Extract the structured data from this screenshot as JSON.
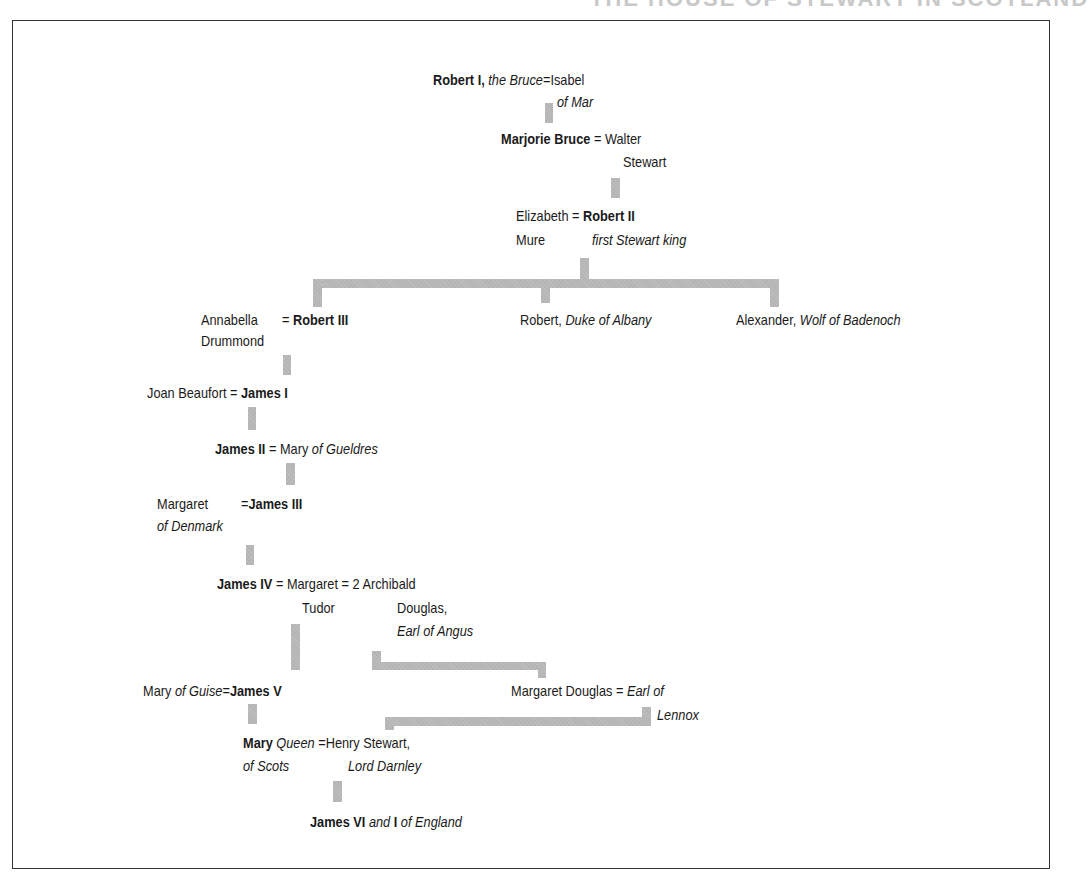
{
  "title": "THE HOUSE OF STEWART IN SCOTLAND",
  "colors": {
    "connector": "#b5b5b5",
    "text": "#1a1a1a",
    "frame": "#333333"
  },
  "tree": {
    "robert_i": {
      "name": "Robert I,",
      "epithet": "the Bruce"
    },
    "isabel": {
      "line1": "Isabel",
      "line2": "of Mar"
    },
    "marjorie": {
      "name": "Marjorie Bruce"
    },
    "walter": {
      "line1": "Walter",
      "line2": "Stewart"
    },
    "elizabeth": {
      "line1": "Elizabeth",
      "line2": "Mure"
    },
    "robert_ii": {
      "name": "Robert II",
      "epithet": "first Stewart king"
    },
    "annabella": {
      "line1": "Annabella",
      "line2": "Drummond"
    },
    "robert_iii": {
      "name": "Robert III"
    },
    "robert_albany": {
      "name": "Robert,",
      "epithet": "Duke of Albany"
    },
    "alexander": {
      "name": "Alexander,",
      "epithet": "Wolf of Badenoch"
    },
    "joan": {
      "name": "Joan Beaufort"
    },
    "james_i": {
      "name": "James I"
    },
    "james_ii": {
      "name": "James II"
    },
    "mary_gueldres": {
      "name": "Mary",
      "epithet": "of Gueldres"
    },
    "margaret_denmark": {
      "line1": "Margaret",
      "line2": "of Denmark"
    },
    "james_iii": {
      "name": "James III"
    },
    "james_iv": {
      "name": "James IV"
    },
    "margaret_tudor": {
      "line1": "Margaret",
      "line2": "Tudor"
    },
    "archibald": {
      "marker": "2",
      "line1": "Archibald",
      "line2": "Douglas,",
      "line3": "Earl of Angus"
    },
    "mary_guise": {
      "name": "Mary",
      "epithet": "of Guise"
    },
    "james_v": {
      "name": "James V"
    },
    "margaret_douglas": {
      "name": "Margaret Douglas"
    },
    "lennox": {
      "line1": "Earl of",
      "line2": "Lennox"
    },
    "mary_qos": {
      "name": "Mary",
      "epithet1": "Queen",
      "epithet2": "of Scots"
    },
    "darnley": {
      "line1": "Henry Stewart,",
      "line2": "Lord Darnley"
    },
    "james_vi": {
      "name": "James VI",
      "and": "and",
      "numeral": "I",
      "of": "of England"
    }
  },
  "symbols": {
    "marriage": "="
  }
}
